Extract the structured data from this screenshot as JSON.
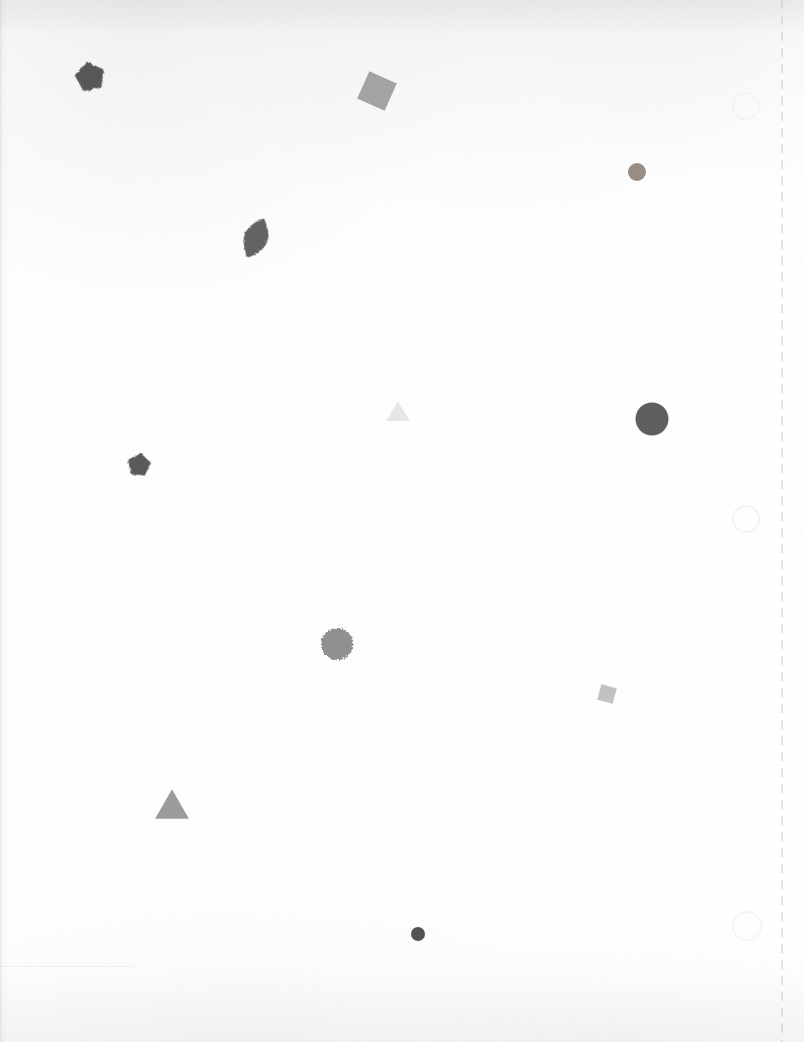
{
  "canvas": {
    "width": 804,
    "height": 1042,
    "background_color": "#ffffff",
    "description": "Scanned white sheet with scattered grayscale geometric shapes"
  },
  "guides": {
    "dashed_line": {
      "name": "vertical-dashed-guide-line",
      "x": 782,
      "y_start": 0,
      "y_end": 1042,
      "color": "#c8c8c8",
      "dash_length": 9,
      "gap_length": 7,
      "thickness": 1
    }
  },
  "ring_marks": [
    {
      "name": "ring-mark-1",
      "cx": 746,
      "cy": 106,
      "r": 14,
      "color": "#f4f4f4",
      "stroke_width": 2
    },
    {
      "name": "ring-mark-2",
      "cx": 746,
      "cy": 519,
      "r": 14,
      "color": "#f3f3f3",
      "stroke_width": 2
    },
    {
      "name": "ring-mark-3",
      "cx": 747,
      "cy": 926,
      "r": 15,
      "color": "#f5f5f5",
      "stroke_width": 2
    }
  ],
  "shapes": [
    {
      "id": "shape-1",
      "name": "pentagon-dark-top-left",
      "type": "pentagon",
      "cx": 90,
      "cy": 77,
      "size": 28,
      "rotation": -12,
      "fill": "#4c4c4c",
      "opacity": 0.94,
      "texture": "mottled"
    },
    {
      "id": "shape-2",
      "name": "square-gray-rotated-top",
      "type": "square",
      "cx": 377,
      "cy": 91,
      "size": 30,
      "rotation": 24,
      "fill": "#9b9b9b",
      "opacity": 0.92,
      "texture": "smooth"
    },
    {
      "id": "shape-3",
      "name": "circle-small-brownish-upper-right",
      "type": "circle",
      "cx": 637,
      "cy": 172,
      "size": 18,
      "rotation": 0,
      "fill": "#8e8279",
      "opacity": 0.9,
      "texture": "grainy"
    },
    {
      "id": "shape-4",
      "name": "leaf-lens-dark-upper-left",
      "type": "leaf",
      "cx": 256,
      "cy": 238,
      "size": 34,
      "rotation": 22,
      "fill": "#575757",
      "opacity": 0.93,
      "texture": "mottled"
    },
    {
      "id": "shape-5",
      "name": "triangle-faint-center",
      "type": "triangle",
      "cx": 398,
      "cy": 411,
      "size": 22,
      "rotation": 0,
      "fill": "#e2e2e2",
      "opacity": 0.85,
      "texture": "smooth"
    },
    {
      "id": "shape-6",
      "name": "circle-large-dark-right",
      "type": "circle",
      "cx": 652,
      "cy": 419,
      "size": 33,
      "rotation": 0,
      "fill": "#565656",
      "opacity": 0.95,
      "texture": "smooth"
    },
    {
      "id": "shape-7",
      "name": "pentagon-dark-mid-left",
      "type": "pentagon",
      "cx": 139,
      "cy": 465,
      "size": 22,
      "rotation": 8,
      "fill": "#4e4e4e",
      "opacity": 0.93,
      "texture": "mottled"
    },
    {
      "id": "shape-8",
      "name": "circle-textured-center",
      "type": "circle",
      "cx": 337,
      "cy": 644,
      "size": 32,
      "rotation": 0,
      "fill": "#8a8a8a",
      "opacity": 0.95,
      "texture": "noisy"
    },
    {
      "id": "shape-9",
      "name": "square-small-light-right",
      "type": "square",
      "cx": 607,
      "cy": 694,
      "size": 16,
      "rotation": 15,
      "fill": "#b9b9b9",
      "opacity": 0.88,
      "texture": "grainy"
    },
    {
      "id": "shape-10",
      "name": "triangle-gray-lower-left",
      "type": "triangle",
      "cx": 172,
      "cy": 804,
      "size": 32,
      "rotation": 0,
      "fill": "#959595",
      "opacity": 0.93,
      "texture": "grainy"
    },
    {
      "id": "shape-11",
      "name": "circle-small-dark-bottom",
      "type": "circle",
      "cx": 418,
      "cy": 934,
      "size": 14,
      "rotation": 0,
      "fill": "#4a4a4a",
      "opacity": 0.95,
      "texture": "smooth"
    }
  ],
  "chart_data": {
    "type": "scatter",
    "title": "",
    "xlabel": "",
    "ylabel": "",
    "xlim": [
      0,
      804
    ],
    "ylim": [
      0,
      1042
    ],
    "grid": false,
    "legend": "none",
    "note": "Scattered abstract grayscale shapes on a scanned page; marker glyph encodes shape type, gray level encodes fill value.",
    "points": [
      {
        "x": 90,
        "y": 77,
        "marker": "pentagon",
        "size": 28,
        "gray": "#4c4c4c"
      },
      {
        "x": 377,
        "y": 91,
        "marker": "square",
        "size": 30,
        "gray": "#9b9b9b"
      },
      {
        "x": 637,
        "y": 172,
        "marker": "circle",
        "size": 18,
        "gray": "#8e8279"
      },
      {
        "x": 256,
        "y": 238,
        "marker": "leaf",
        "size": 34,
        "gray": "#575757"
      },
      {
        "x": 398,
        "y": 411,
        "marker": "triangle",
        "size": 22,
        "gray": "#e2e2e2"
      },
      {
        "x": 652,
        "y": 419,
        "marker": "circle",
        "size": 33,
        "gray": "#565656"
      },
      {
        "x": 139,
        "y": 465,
        "marker": "pentagon",
        "size": 22,
        "gray": "#4e4e4e"
      },
      {
        "x": 337,
        "y": 644,
        "marker": "circle",
        "size": 32,
        "gray": "#8a8a8a"
      },
      {
        "x": 607,
        "y": 694,
        "marker": "square",
        "size": 16,
        "gray": "#b9b9b9"
      },
      {
        "x": 172,
        "y": 804,
        "marker": "triangle",
        "size": 32,
        "gray": "#959595"
      },
      {
        "x": 418,
        "y": 934,
        "marker": "circle",
        "size": 14,
        "gray": "#4a4a4a"
      }
    ]
  }
}
